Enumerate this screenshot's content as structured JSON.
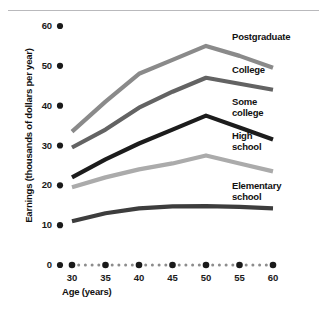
{
  "chart_data": {
    "type": "line",
    "title": "",
    "subtitle": "",
    "xlabel": "Age (years)",
    "ylabel": "Earnings (thousands of dollars per year)",
    "x": [
      30,
      35,
      40,
      45,
      50,
      55,
      60
    ],
    "xlim": [
      28,
      61
    ],
    "ylim": [
      0,
      62
    ],
    "xticks": [
      "30",
      "35",
      "40",
      "45",
      "50",
      "55",
      "60"
    ],
    "yticks": [
      "0",
      "10",
      "20",
      "30",
      "40",
      "50",
      "60"
    ],
    "grid": false,
    "legend_position": "inline-right",
    "series": [
      {
        "name": "Postgraduate",
        "color": "#8a8a8a",
        "values": [
          33.5,
          41.0,
          48.0,
          51.5,
          55.0,
          52.5,
          49.5
        ],
        "label_x": 232,
        "label_y": 32
      },
      {
        "name": "College",
        "color": "#636363",
        "values": [
          29.5,
          34.0,
          39.5,
          43.5,
          47.0,
          45.5,
          44.0
        ],
        "label_x": 232,
        "label_y": 65
      },
      {
        "name": "Some college",
        "color": "#1c1c1c",
        "values": [
          22.0,
          26.5,
          30.5,
          34.0,
          37.5,
          34.5,
          31.5
        ],
        "label_x": 232,
        "label_y": 97
      },
      {
        "name": "High school",
        "color": "#ababab",
        "values": [
          19.5,
          22.0,
          24.0,
          25.5,
          27.5,
          25.5,
          23.5
        ],
        "label_x": 232,
        "label_y": 131
      },
      {
        "name": "Elementary school",
        "color": "#3d3d3d",
        "values": [
          11.0,
          13.0,
          14.2,
          14.7,
          14.8,
          14.6,
          14.2
        ],
        "label_x": 232,
        "label_y": 181
      }
    ],
    "axis_dot_color": "#1a1a1a",
    "axis_minor_dot_color": "#8c8c8c",
    "x_axis_minor_dots_per_gap": 5,
    "top_rule_color": "#b9b9bc"
  }
}
